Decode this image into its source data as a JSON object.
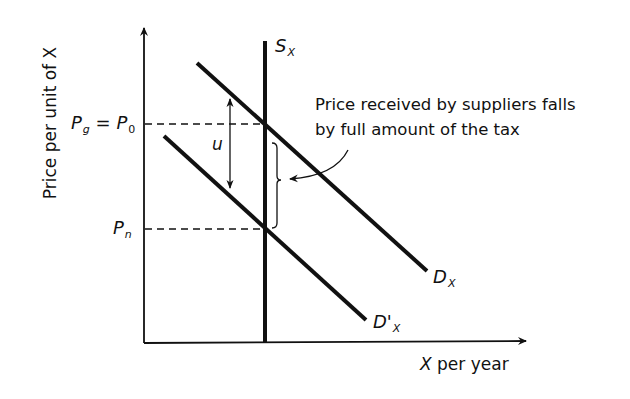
{
  "diagram": {
    "type": "supply-demand",
    "axes": {
      "y_label": "Price per unit of X",
      "x_label_var": "X",
      "x_label_rest": " per year"
    },
    "curves": {
      "supply": {
        "label": "S",
        "subscript": "X",
        "kind": "vertical"
      },
      "demand": {
        "label": "D",
        "subscript": "X"
      },
      "demand_shifted": {
        "label": "D'",
        "subscript": "X"
      }
    },
    "price_levels": {
      "p0": {
        "lhs": "P",
        "lhs_sub": "g",
        "eq": " = ",
        "rhs": "P",
        "rhs_sub": "0"
      },
      "pn": {
        "label": "P",
        "sub": "n"
      }
    },
    "tax_marker": {
      "label": "u"
    },
    "annotation": {
      "line1": "Price received by suppliers falls",
      "line2": "by full amount of the tax"
    },
    "colors": {
      "ink": "#111111",
      "background": "#ffffff"
    }
  }
}
